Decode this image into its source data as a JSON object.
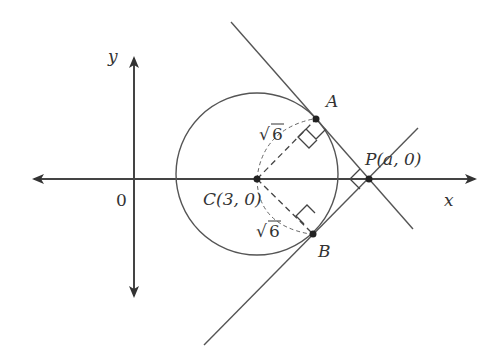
{
  "diagram": {
    "type": "coordinate-geometry",
    "axes": {
      "x_label": "x",
      "y_label": "y",
      "origin_label": "0"
    },
    "points": {
      "C": {
        "label": "C(3, 0)",
        "name": "C"
      },
      "P": {
        "label": "P(a, 0)",
        "name": "P"
      },
      "A": {
        "label": "A",
        "name": "A"
      },
      "B": {
        "label": "B",
        "name": "B"
      }
    },
    "radius_labels": {
      "CA": "√6",
      "CB": "√6"
    },
    "label_text": {
      "x": "x",
      "y": "y",
      "origin": "0",
      "A": "A",
      "B": "B",
      "C": "C(3, 0)",
      "P": "P(a, 0)",
      "sqrt6_upper_radical": "√",
      "sqrt6_upper_num": "6",
      "sqrt6_lower_radical": "√",
      "sqrt6_lower_num": "6"
    },
    "colors": {
      "line": "#444444",
      "point": "#222222",
      "background": "#ffffff"
    }
  }
}
